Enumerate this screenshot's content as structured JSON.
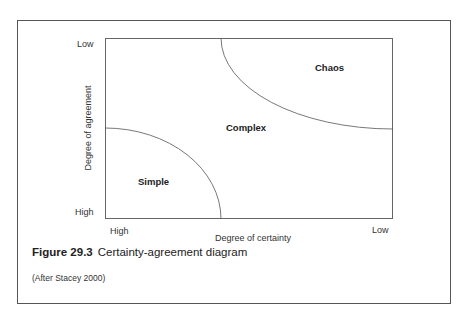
{
  "diagram": {
    "y_axis": {
      "label": "Degree of agreement",
      "top": "Low",
      "bottom": "High"
    },
    "x_axis": {
      "label": "Degree of certainty",
      "left": "High",
      "right": "Low"
    },
    "regions": {
      "simple": "Simple",
      "complex": "Complex",
      "chaos": "Chaos"
    },
    "caption": {
      "number": "Figure 29.3",
      "title": "Certainty-agreement diagram"
    },
    "source": "(After Stacey 2000)"
  }
}
